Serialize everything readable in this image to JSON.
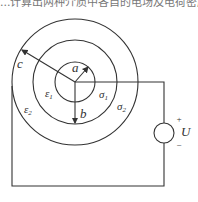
{
  "caption": {
    "text": "...计算出两种介质中各自的电场及电荷密度ρS。"
  },
  "diagram": {
    "labels": {
      "a": "a",
      "b": "b",
      "c": "c",
      "eps1": "ε",
      "eps1_sub": "1",
      "eps2": "ε",
      "eps2_sub": "2",
      "sigma1": "σ",
      "sigma1_sub": "1",
      "sigma2": "σ",
      "sigma2_sub": "2",
      "U": "U",
      "plus": "+",
      "minus": "−"
    },
    "colors": {
      "line": "#333333"
    }
  }
}
